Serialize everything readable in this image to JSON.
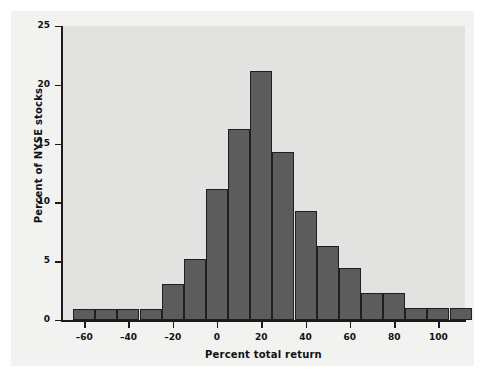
{
  "chart_data": {
    "type": "bar",
    "title": "",
    "subtitle": "",
    "xlabel": "Percent total return",
    "ylabel": "Percent of NYSE stocks",
    "xlim": [
      -70,
      112
    ],
    "ylim": [
      0,
      25
    ],
    "xticks": [
      -60,
      -40,
      -20,
      0,
      20,
      40,
      60,
      80,
      100
    ],
    "xtick_labels": [
      "–60",
      "–40",
      "–20",
      "0",
      "20",
      "40",
      "60",
      "80",
      "100"
    ],
    "yticks": [
      0,
      5,
      10,
      15,
      20,
      25
    ],
    "ytick_labels": [
      "0",
      "5",
      "10",
      "15",
      "20",
      "25"
    ],
    "grid": false,
    "legend": null,
    "bin_width": 10,
    "bin_edges": [
      -65,
      -55,
      -45,
      -35,
      -25,
      -15,
      -5,
      5,
      15,
      25,
      35,
      45,
      55,
      65,
      75,
      85,
      95,
      105,
      115
    ],
    "categories": [
      "-65 to -55",
      "-55 to -45",
      "-45 to -35",
      "-35 to -25",
      "-25 to -15",
      "-15 to -5",
      "-5 to 5",
      "5 to 15",
      "15 to 25",
      "25 to 35",
      "35 to 45",
      "45 to 55",
      "55 to 65",
      "65 to 75",
      "75 to 85",
      "85 to 95",
      "95 to 105",
      "105 to 115"
    ],
    "values": [
      0.9,
      0.9,
      0.9,
      0.9,
      3.1,
      5.2,
      11.1,
      16.2,
      21.2,
      14.3,
      9.3,
      6.3,
      4.4,
      2.3,
      2.3,
      1.0,
      1.0,
      1.0
    ],
    "bar_color": "#5c5c5c",
    "bar_edge_color": "#1f1f1f",
    "panel_color": "#e2e2e1",
    "page_color": "#f2f2f1",
    "axis_color": "#1b1b1b"
  }
}
